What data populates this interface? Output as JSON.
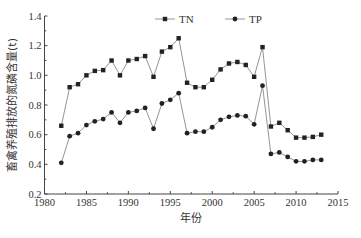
{
  "chart_data": {
    "type": "line",
    "title": "",
    "xlabel": "年份",
    "ylabel": "畜禽养殖排放的氮磷含量(t)",
    "xlim": [
      1980,
      2015
    ],
    "ylim": [
      0.2,
      1.4
    ],
    "xticks": [
      1980,
      1985,
      1990,
      1995,
      2000,
      2005,
      2010,
      2015
    ],
    "yticks": [
      0.2,
      0.4,
      0.6,
      0.8,
      1.0,
      1.2,
      1.4
    ],
    "ytick_labels": [
      "0.2",
      "0.4",
      "0.6",
      "0.8",
      "1.0",
      "1.2",
      "1.4"
    ],
    "grid": false,
    "legend_position": "top",
    "x": [
      1982,
      1983,
      1984,
      1985,
      1986,
      1987,
      1988,
      1989,
      1990,
      1991,
      1992,
      1993,
      1994,
      1995,
      1996,
      1997,
      1998,
      1999,
      2000,
      2001,
      2002,
      2003,
      2004,
      2005,
      2006,
      2007,
      2008,
      2009,
      2010,
      2011,
      2012,
      2013
    ],
    "series": [
      {
        "name": "TN",
        "marker": "square",
        "color": "#222222",
        "values": [
          0.66,
          0.92,
          0.94,
          1.0,
          1.03,
          1.035,
          1.1,
          1.0,
          1.1,
          1.11,
          1.13,
          0.99,
          1.16,
          1.19,
          1.25,
          0.95,
          0.92,
          0.92,
          0.97,
          1.04,
          1.08,
          1.09,
          1.07,
          0.99,
          1.19,
          0.655,
          0.68,
          0.63,
          0.58,
          0.58,
          0.585,
          0.6
        ]
      },
      {
        "name": "TP",
        "marker": "circle",
        "color": "#222222",
        "values": [
          0.41,
          0.59,
          0.61,
          0.665,
          0.69,
          0.705,
          0.75,
          0.68,
          0.75,
          0.76,
          0.78,
          0.64,
          0.81,
          0.835,
          0.88,
          0.61,
          0.62,
          0.62,
          0.65,
          0.7,
          0.72,
          0.73,
          0.725,
          0.67,
          0.93,
          0.47,
          0.48,
          0.45,
          0.42,
          0.42,
          0.43,
          0.43
        ]
      }
    ]
  },
  "colors": {
    "axis": "#444444",
    "line": "#888888",
    "marker": "#222222"
  }
}
